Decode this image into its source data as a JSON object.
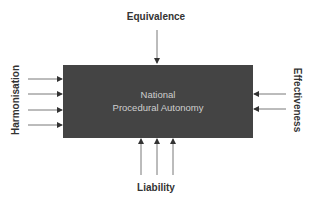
{
  "diagram": {
    "center_box": {
      "line1": "National",
      "line2": "Procedural Autonomy",
      "fill_color": "#444444",
      "text_color": "#cfcfcf"
    },
    "top": {
      "label": "Equivalence",
      "arrow_count": 1,
      "direction": "down"
    },
    "left": {
      "label": "Harmonisation",
      "arrow_count": 4,
      "direction": "right"
    },
    "right": {
      "label": "Effectiveness",
      "arrow_count": 2,
      "direction": "left"
    },
    "bottom": {
      "label": "Liability",
      "arrow_count": 3,
      "direction": "up"
    },
    "arrow_color": "#555555"
  }
}
